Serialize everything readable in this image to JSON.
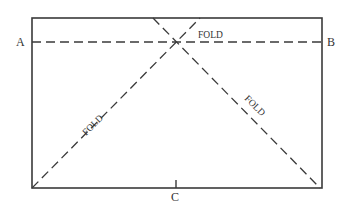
{
  "diagram": {
    "type": "folding-diagram",
    "rectangle": {
      "x": 32,
      "y": 18,
      "width": 290,
      "height": 170
    },
    "points": {
      "A": {
        "label": "A"
      },
      "B": {
        "label": "B"
      },
      "C": {
        "label": "C"
      }
    },
    "folds": [
      {
        "id": "horizontal",
        "label": "FOLD",
        "from": "A",
        "to": "B"
      },
      {
        "id": "diagonal-left",
        "label": "FOLD",
        "from": "bottom-left-corner",
        "to": "top-edge"
      },
      {
        "id": "diagonal-right",
        "label": "FOLD",
        "from": "top-edge",
        "to": "bottom-right-corner"
      }
    ],
    "colors": {
      "line": "#3a3a3a",
      "text": "#333333",
      "background": "#ffffff"
    }
  }
}
